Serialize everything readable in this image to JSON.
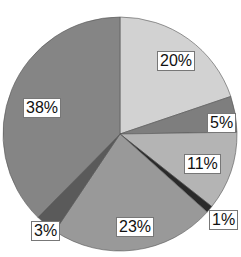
{
  "chart_data": {
    "type": "pie",
    "title": "",
    "start_angle_deg": 90,
    "direction": "clockwise",
    "slices": [
      {
        "label": "20%",
        "value": 20,
        "color": "#d2d2d2"
      },
      {
        "label": "5%",
        "value": 5,
        "color": "#7e7e7e"
      },
      {
        "label": "11%",
        "value": 11,
        "color": "#b4b4b4"
      },
      {
        "label": "1%",
        "value": 1,
        "color": "#2a2a2a"
      },
      {
        "label": "23%",
        "value": 23,
        "color": "#999999"
      },
      {
        "label": "3%",
        "value": 3,
        "color": "#5a5a5a"
      },
      {
        "label": "38%",
        "value": 38,
        "color": "#858585"
      }
    ],
    "label_positions": [
      {
        "x": 157,
        "y": 51
      },
      {
        "x": 207,
        "y": 113
      },
      {
        "x": 184,
        "y": 154
      },
      {
        "x": 209,
        "y": 210
      },
      {
        "x": 116,
        "y": 217
      },
      {
        "x": 31,
        "y": 221
      },
      {
        "x": 23,
        "y": 98
      }
    ],
    "center": {
      "x": 120,
      "y": 134
    },
    "radius": 117
  }
}
